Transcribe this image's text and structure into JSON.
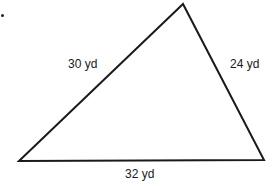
{
  "figure": {
    "type": "triangle",
    "stroke_color": "#1a1a1a",
    "background": "#ffffff",
    "vertices": {
      "top": [
        183,
        4
      ],
      "bottom_left": [
        19,
        161
      ],
      "bottom_right": [
        264,
        160
      ]
    },
    "sides": {
      "left": {
        "label": "30 yd",
        "length": 30,
        "unit": "yd"
      },
      "right": {
        "label": "24 yd",
        "length": 24,
        "unit": "yd"
      },
      "bottom": {
        "label": "32 yd",
        "length": 32,
        "unit": "yd"
      }
    }
  }
}
